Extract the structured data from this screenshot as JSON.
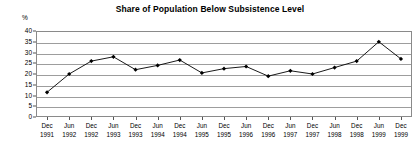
{
  "chart_data": {
    "type": "line",
    "title": "Share of Population Below Subsistence Level",
    "xlabel": "",
    "ylabel": "%",
    "ylim": [
      0,
      40
    ],
    "ytick_step": 5,
    "yticks": [
      40,
      35,
      30,
      25,
      20,
      15,
      10,
      5,
      0
    ],
    "grid": true,
    "legend": "none",
    "marker": "diamond",
    "line_color": "#000000",
    "grid_color": "#9d9d9d",
    "border_color": "#8a8a8a",
    "categories": [
      "Dec 1991",
      "Jun 1992",
      "Dec 1992",
      "Jun 1993",
      "Dec 1993",
      "Jun 1994",
      "Dec 1994",
      "Jun 1995",
      "Dec 1995",
      "Jun 1996",
      "Dec 1996",
      "Jun 1997",
      "Dec 1997",
      "Jun 1998",
      "Dec 1998",
      "Jun 1999",
      "Dec 1999"
    ],
    "category_months": [
      "Dec",
      "Jun",
      "Dec",
      "Jun",
      "Dec",
      "Jun",
      "Dec",
      "Jun",
      "Dec",
      "Jun",
      "Dec",
      "Jun",
      "Dec",
      "Jun",
      "Dec",
      "Jun",
      "Dec"
    ],
    "category_years": [
      "1991",
      "1992",
      "1992",
      "1993",
      "1993",
      "1994",
      "1994",
      "1995",
      "1995",
      "1996",
      "1996",
      "1997",
      "1997",
      "1998",
      "1998",
      "1999",
      "1999"
    ],
    "values": [
      11.5,
      20.0,
      26.0,
      28.0,
      22.0,
      24.0,
      26.5,
      20.5,
      22.5,
      23.5,
      19.0,
      21.5,
      20.0,
      23.0,
      26.0,
      35.0,
      27.0
    ]
  }
}
